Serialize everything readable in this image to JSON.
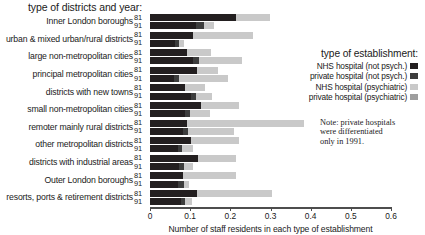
{
  "heading": "type of districts and year:",
  "legend": {
    "title": "type of establishment:",
    "items": [
      {
        "label": "NHS hospital (not psych.)",
        "color": "#231f20"
      },
      {
        "label": "private hospital (not psych.)",
        "color": "#3d3d3d"
      },
      {
        "label": "NHS hospital (psychiatric)",
        "color": "#c9c9c9"
      },
      {
        "label": "private hospital (psychiatric)",
        "color": "#9e9e9e"
      }
    ]
  },
  "note": {
    "line1": "Note: private hospitals",
    "line2": "were differentiated",
    "line3": "only in 1991."
  },
  "years": [
    "81",
    "91"
  ],
  "chart_data": {
    "type": "bar",
    "orientation": "horizontal",
    "stacked": true,
    "title": "",
    "xlabel": "Number of staff residents in each type of establishment",
    "ylabel": "type of districts and year:",
    "xlim": [
      0,
      0.6
    ],
    "xticks": [
      "0",
      "0.1",
      "0.2",
      "0.3",
      "0.4",
      "0.5",
      "0.6"
    ],
    "xtick_values": [
      0,
      0.1,
      0.2,
      0.3,
      0.4,
      0.5,
      0.6
    ],
    "grid": false,
    "legend_position": "right",
    "series": [
      {
        "name": "NHS hospital (not psych.)",
        "color": "#231f20"
      },
      {
        "name": "private hospital (not psych.)",
        "color": "#3d3d3d"
      },
      {
        "name": "NHS hospital (psychiatric)",
        "color": "#c9c9c9"
      },
      {
        "name": "private hospital (psychiatric)",
        "color": "#9e9e9e"
      }
    ],
    "categories": [
      "Inner London boroughs",
      "urban & mixed urban/rural districts",
      "large non-metropolitan cities",
      "principal metropolitan cities",
      "districts with new towns",
      "small non-metropolitan cities",
      "remoter mainly rural districts",
      "other metropolitan districts",
      "districts with industrial areas",
      "Outer London boroughs",
      "resorts, ports & retirement districts"
    ],
    "groups": [
      {
        "category": "Inner London boroughs",
        "bars": [
          {
            "year": "81",
            "segments": [
              0.215,
              0.0,
              0.083,
              0.0
            ],
            "total": 0.298
          },
          {
            "year": "91",
            "segments": [
              0.115,
              0.02,
              0.025,
              0.0
            ],
            "total": 0.16
          }
        ]
      },
      {
        "category": "urban & mixed urban/rural districts",
        "bars": [
          {
            "year": "81",
            "segments": [
              0.108,
              0.0,
              0.148,
              0.0
            ],
            "total": 0.256
          },
          {
            "year": "91",
            "segments": [
              0.062,
              0.01,
              0.013,
              0.0
            ],
            "total": 0.085
          }
        ]
      },
      {
        "category": "large non-metropolitan cities",
        "bars": [
          {
            "year": "81",
            "segments": [
              0.093,
              0.0,
              0.06,
              0.0
            ],
            "total": 0.153
          },
          {
            "year": "91",
            "segments": [
              0.108,
              0.013,
              0.108,
              0.0
            ],
            "total": 0.229
          }
        ]
      },
      {
        "category": "principal metropolitan cities",
        "bars": [
          {
            "year": "81",
            "segments": [
              0.118,
              0.0,
              0.052,
              0.0
            ],
            "total": 0.17
          },
          {
            "year": "91",
            "segments": [
              0.06,
              0.013,
              0.12,
              0.0
            ],
            "total": 0.193
          }
        ]
      },
      {
        "category": "districts with new towns",
        "bars": [
          {
            "year": "81",
            "segments": [
              0.088,
              0.0,
              0.05,
              0.0
            ],
            "total": 0.138
          },
          {
            "year": "91",
            "segments": [
              0.102,
              0.012,
              0.04,
              0.0
            ],
            "total": 0.154
          }
        ]
      },
      {
        "category": "small non-metropolitan cities",
        "bars": [
          {
            "year": "81",
            "segments": [
              0.128,
              0.0,
              0.093,
              0.0
            ],
            "total": 0.221
          },
          {
            "year": "91",
            "segments": [
              0.088,
              0.012,
              0.05,
              0.0
            ],
            "total": 0.15
          }
        ]
      },
      {
        "category": "remoter mainly rural districts",
        "bars": [
          {
            "year": "81",
            "segments": [
              0.093,
              0.0,
              0.29,
              0.0
            ],
            "total": 0.383
          },
          {
            "year": "91",
            "segments": [
              0.082,
              0.012,
              0.115,
              0.0
            ],
            "total": 0.209
          }
        ]
      },
      {
        "category": "other metropolitan districts",
        "bars": [
          {
            "year": "81",
            "segments": [
              0.103,
              0.0,
              0.118,
              0.0
            ],
            "total": 0.221
          },
          {
            "year": "91",
            "segments": [
              0.07,
              0.01,
              0.026,
              0.0
            ],
            "total": 0.106
          }
        ]
      },
      {
        "category": "districts with industrial areas",
        "bars": [
          {
            "year": "81",
            "segments": [
              0.12,
              0.0,
              0.093,
              0.0
            ],
            "total": 0.213
          },
          {
            "year": "91",
            "segments": [
              0.072,
              0.012,
              0.022,
              0.0
            ],
            "total": 0.106
          }
        ]
      },
      {
        "category": "Outer London boroughs",
        "bars": [
          {
            "year": "81",
            "segments": [
              0.082,
              0.0,
              0.133,
              0.0
            ],
            "total": 0.215
          },
          {
            "year": "91",
            "segments": [
              0.07,
              0.014,
              0.013,
              0.0
            ],
            "total": 0.097
          }
        ]
      },
      {
        "category": "resorts, ports & retirement districts",
        "bars": [
          {
            "year": "81",
            "segments": [
              0.118,
              0.0,
              0.185,
              0.0
            ],
            "total": 0.303
          },
          {
            "year": "91",
            "segments": [
              0.078,
              0.008,
              0.018,
              0.0
            ],
            "total": 0.104
          }
        ]
      }
    ]
  }
}
